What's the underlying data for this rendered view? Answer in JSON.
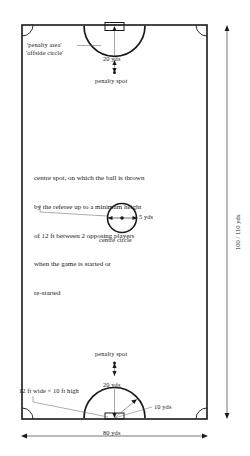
{
  "diagram": {
    "colors": {
      "line": "#1a1a1a",
      "background": "#ffffff",
      "text": "#15191c"
    },
    "labels": {
      "penalty_area": "'penalty area'",
      "offside_circle": "'offside circle'",
      "top_twenty_yds": "20 yds",
      "top_penalty_spot": "penalty spot",
      "centre_five_yds": "5 yds",
      "centre_circle": "centre circle",
      "bottom_penalty_spot": "penalty spot",
      "bottom_twenty_yds": "20 yds",
      "goal_size": "12 ft wide × 10 ft high",
      "ten_yds": "10 yds",
      "width_eighty_yds": "80 yds",
      "length_hundred_yds": "100 / 110 yds"
    },
    "centre_note": {
      "line1": "centre spot, on which the ball is thrown",
      "line2": "by the referee up to a minimum height",
      "line3": "of 12 ft between 2 opposing players",
      "line4": "when the game is started or",
      "line5": "re-started"
    },
    "measurements": {
      "pitch_width": "80 yds",
      "pitch_length": "100 / 110 yds",
      "penalty_arc_radius": "20 yds",
      "centre_circle_radius": "5 yds",
      "corner_arc_radius": "10 yds",
      "goal_width_ft": "12 ft",
      "goal_height_ft": "10 ft",
      "throw_height_ft": "12 ft",
      "opposing_players": "2"
    }
  }
}
